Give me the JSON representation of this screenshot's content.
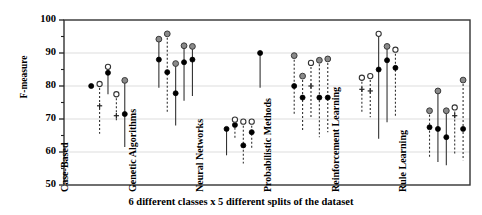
{
  "axes": {
    "ylabel": "F-measure",
    "caption": "6 different classes x 5 different splits of the dataset",
    "yticks": [
      "100",
      "90",
      "80",
      "70",
      "60",
      "50"
    ]
  },
  "groups": [
    {
      "label": "Case-Based"
    },
    {
      "label": "Genetic Algorithms"
    },
    {
      "label": "Neural Networks"
    },
    {
      "label": "Probabilistic Methods"
    },
    {
      "label": "Reinforcement Learning"
    },
    {
      "label": "Rule Learning"
    }
  ],
  "chart_data": {
    "type": "scatter",
    "title": "",
    "xlabel": "6 different classes x 5 different splits of the dataset",
    "ylabel": "F-measure",
    "ylim": [
      50,
      100
    ],
    "ytick_values": [
      50,
      60,
      70,
      80,
      90,
      100
    ],
    "grid": "horizontal-major",
    "legend": "none",
    "categories": [
      "Case-Based",
      "Genetic Algorithms",
      "Neural Networks",
      "Probabilistic Methods",
      "Reinforcement Learning",
      "Rule Learning"
    ],
    "marker_styles": {
      "filled_black": "solid black dot",
      "open": "open circle",
      "gray": "gray filled circle",
      "plus": "plus sign"
    },
    "splits_per_category": 5,
    "series": [
      {
        "name": "Case-Based",
        "points": [
          {
            "split": 1,
            "top": 80.0,
            "top_marker": "filled_black",
            "mid": null,
            "mid_marker": null,
            "bottom": 80.0,
            "line": "solid"
          },
          {
            "split": 2,
            "top": 80.6,
            "top_marker": "open",
            "mid": 74.0,
            "mid_marker": "plus",
            "bottom": 65.5,
            "line": "dashed"
          },
          {
            "split": 3,
            "top": 85.8,
            "top_marker": "open",
            "mid": 84.0,
            "mid_marker": "filled_black",
            "bottom": 77.5,
            "line": "solid"
          },
          {
            "split": 4,
            "top": 77.5,
            "top_marker": "open",
            "mid": 71.0,
            "mid_marker": "plus",
            "bottom": 69.0,
            "line": "dashed"
          },
          {
            "split": 5,
            "top": 81.7,
            "top_marker": "gray",
            "mid": 71.5,
            "mid_marker": "filled_black",
            "bottom": 61.5,
            "line": "solid"
          }
        ]
      },
      {
        "name": "Genetic Algorithms",
        "points": [
          {
            "split": 1,
            "top": 94.2,
            "top_marker": "gray",
            "mid": 88.0,
            "mid_marker": "filled_black",
            "bottom": 79.5,
            "line": "solid"
          },
          {
            "split": 2,
            "top": 95.8,
            "top_marker": "gray",
            "mid": 84.2,
            "mid_marker": "filled_black",
            "bottom": 72.0,
            "line": "dashed"
          },
          {
            "split": 3,
            "top": 86.8,
            "top_marker": "gray",
            "mid": 77.8,
            "mid_marker": "filled_black",
            "bottom": 68.0,
            "line": "solid"
          },
          {
            "split": 4,
            "top": 92.2,
            "top_marker": "gray",
            "mid": 87.2,
            "mid_marker": "filled_black",
            "bottom": 75.5,
            "line": "solid"
          },
          {
            "split": 5,
            "top": 92.0,
            "top_marker": "gray",
            "mid": 88.0,
            "mid_marker": "filled_black",
            "bottom": 77.0,
            "line": "solid"
          }
        ]
      },
      {
        "name": "Neural Networks",
        "points": [
          {
            "split": 1,
            "top": 67.0,
            "top_marker": "filled_black",
            "mid": null,
            "mid_marker": null,
            "bottom": 59.0,
            "line": "solid"
          },
          {
            "split": 2,
            "top": 69.8,
            "top_marker": "open",
            "mid": 68.2,
            "mid_marker": "filled_black",
            "bottom": 64.0,
            "line": "dashed"
          },
          {
            "split": 3,
            "top": 69.2,
            "top_marker": "open",
            "mid": 62.0,
            "mid_marker": "filled_black",
            "bottom": 56.5,
            "line": "dashed"
          },
          {
            "split": 4,
            "top": 69.2,
            "top_marker": "open",
            "mid": 66.0,
            "mid_marker": "filled_black",
            "bottom": 61.0,
            "line": "dashed"
          },
          {
            "split": 5,
            "top": 90.0,
            "top_marker": "filled_black",
            "mid": null,
            "mid_marker": null,
            "bottom": 79.5,
            "line": "solid"
          }
        ]
      },
      {
        "name": "Probabilistic Methods",
        "points": [
          {
            "split": 1,
            "top": 89.2,
            "top_marker": "gray",
            "mid": 80.0,
            "mid_marker": "filled_black",
            "bottom": 71.5,
            "line": "dashed"
          },
          {
            "split": 2,
            "top": 83.0,
            "top_marker": "gray",
            "mid": 76.5,
            "mid_marker": "filled_black",
            "bottom": 66.5,
            "line": "dashed"
          },
          {
            "split": 3,
            "top": 87.0,
            "top_marker": "open",
            "mid": 80.0,
            "mid_marker": "plus",
            "bottom": 70.5,
            "line": "dashed"
          },
          {
            "split": 4,
            "top": 87.8,
            "top_marker": "gray",
            "mid": 76.5,
            "mid_marker": "filled_black",
            "bottom": 64.5,
            "line": "dashed"
          },
          {
            "split": 5,
            "top": 88.2,
            "top_marker": "gray",
            "mid": 76.5,
            "mid_marker": "filled_black",
            "bottom": 66.0,
            "line": "dashed"
          }
        ]
      },
      {
        "name": "Reinforcement Learning",
        "points": [
          {
            "split": 1,
            "top": 82.5,
            "top_marker": "open",
            "mid": 79.0,
            "mid_marker": "plus",
            "bottom": 72.0,
            "line": "dashed"
          },
          {
            "split": 2,
            "top": 83.0,
            "top_marker": "open",
            "mid": 78.5,
            "mid_marker": "plus",
            "bottom": 70.5,
            "line": "dashed"
          },
          {
            "split": 3,
            "top": 95.8,
            "top_marker": "open",
            "mid": 85.0,
            "mid_marker": "filled_black",
            "bottom": 64.0,
            "line": "solid"
          },
          {
            "split": 4,
            "top": 92.0,
            "top_marker": "gray",
            "mid": 87.8,
            "mid_marker": "filled_black",
            "bottom": 69.0,
            "line": "solid"
          },
          {
            "split": 5,
            "top": 91.0,
            "top_marker": "open",
            "mid": 85.5,
            "mid_marker": "filled_black",
            "bottom": 70.5,
            "line": "dashed"
          }
        ]
      },
      {
        "name": "Rule Learning",
        "points": [
          {
            "split": 1,
            "top": 72.5,
            "top_marker": "gray",
            "mid": 67.5,
            "mid_marker": "filled_black",
            "bottom": 58.5,
            "line": "dashed"
          },
          {
            "split": 2,
            "top": 78.5,
            "top_marker": "gray",
            "mid": 67.0,
            "mid_marker": "filled_black",
            "bottom": 57.0,
            "line": "solid"
          },
          {
            "split": 3,
            "top": 72.5,
            "top_marker": "gray",
            "mid": 64.5,
            "mid_marker": "filled_black",
            "bottom": 56.0,
            "line": "solid"
          },
          {
            "split": 4,
            "top": 73.5,
            "top_marker": "open",
            "mid": 71.0,
            "mid_marker": "plus",
            "bottom": 59.5,
            "line": "dashed"
          },
          {
            "split": 5,
            "top": 81.8,
            "top_marker": "gray",
            "mid": 67.0,
            "mid_marker": "filled_black",
            "bottom": 57.5,
            "line": "dashed"
          }
        ]
      }
    ]
  }
}
